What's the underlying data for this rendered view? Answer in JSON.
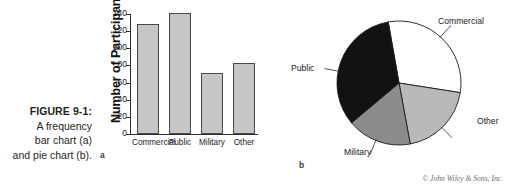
{
  "caption": {
    "title": "FIGURE 9-1:",
    "line2": "A frequency",
    "line3": "bar chart (a)",
    "line4": "and pie chart (b)."
  },
  "panels": {
    "a_letter": "a",
    "b_letter": "b"
  },
  "credit": "© John Wiley & Sons, Inc.",
  "colors": {
    "bar_fill": "#c6c6c6",
    "bar_stroke": "#4a4a4a",
    "axis": "#2b2b2b",
    "slice_commercial": "#ffffff",
    "slice_other": "#b9b9b9",
    "slice_military": "#8c8c8c",
    "slice_public": "#121212",
    "text": "#1b1b1b",
    "credit_text": "#6d6d6d"
  },
  "chart_data": [
    {
      "type": "bar",
      "title": "",
      "xlabel": "",
      "ylabel": "Number of Participants",
      "categories": [
        "Commercial",
        "Public",
        "Military",
        "Other"
      ],
      "values": [
        128,
        141,
        71,
        83
      ],
      "ylim": [
        0,
        140
      ],
      "yticks": [
        0,
        20,
        40,
        60,
        80,
        100,
        120,
        140
      ],
      "ytick_labels": [
        "0",
        "20",
        "40",
        "60",
        "80",
        "100",
        "120",
        "140"
      ],
      "grid": false,
      "legend": "none",
      "panel": "a"
    },
    {
      "type": "pie",
      "title": "",
      "labels": [
        "Commercial",
        "Other",
        "Military",
        "Public"
      ],
      "values": [
        128,
        83,
        71,
        141
      ],
      "percentages": [
        30.4,
        19.7,
        16.9,
        33.5
      ],
      "start_angle_deg": -10,
      "direction": "clockwise",
      "slice_colors": [
        "#ffffff",
        "#b9b9b9",
        "#8c8c8c",
        "#121212"
      ],
      "legend": "leader-line labels",
      "panel": "b"
    }
  ]
}
